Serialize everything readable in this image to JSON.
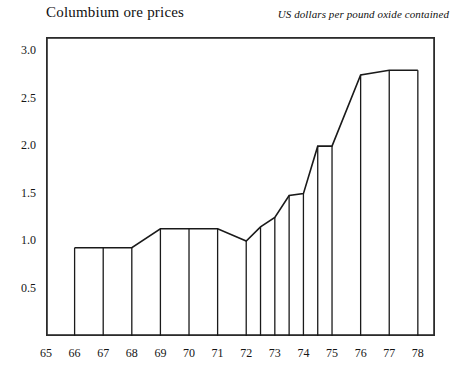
{
  "chart_data": {
    "type": "area",
    "title": "Columbium ore prices",
    "subtitle": "US dollars per pound oxide contained",
    "xlabel": "",
    "ylabel": "",
    "ylim": [
      0,
      3.15
    ],
    "xlim": [
      65,
      78.6
    ],
    "grid": false,
    "legend": null,
    "ytick_labels": [
      "3.0",
      "2.5",
      "2.0",
      "1.5",
      "1.0",
      "0.5"
    ],
    "ytick_values": [
      3.0,
      2.5,
      2.0,
      1.5,
      1.0,
      0.5
    ],
    "xtick_labels": [
      "65",
      "66",
      "67",
      "68",
      "69",
      "70",
      "71",
      "72",
      "73",
      "74",
      "75",
      "76",
      "77",
      "78"
    ],
    "xtick_values": [
      65,
      66,
      67,
      68,
      69,
      70,
      71,
      72,
      73,
      74,
      75,
      76,
      77,
      78
    ],
    "x_minor_interval": 0.5,
    "series_note": "step profile with vertical drop lines to axis at each period boundary",
    "x": [
      66,
      67,
      68,
      69,
      70,
      71,
      72,
      72.5,
      73,
      73.5,
      74,
      74.5,
      75,
      76,
      77,
      78
    ],
    "values": [
      0.93,
      0.93,
      0.93,
      1.13,
      1.13,
      1.13,
      1.0,
      1.15,
      1.25,
      1.48,
      1.5,
      2.0,
      2.0,
      2.75,
      2.8,
      2.8
    ],
    "drop_line_x": [
      66,
      67,
      68,
      69,
      70,
      71,
      72,
      72.5,
      73,
      73.5,
      74,
      74.5,
      75,
      76,
      77,
      78
    ],
    "line_color": "#1a1a1a",
    "axis_color": "#2b2b2b",
    "background": "#ffffff"
  },
  "icons": {
    "axis_frame": "plot-frame"
  }
}
